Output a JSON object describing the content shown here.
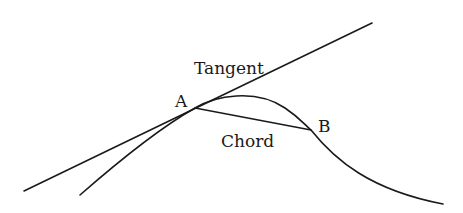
{
  "diagram": {
    "labels": {
      "tangent": "Tangent",
      "chord": "Chord",
      "point_a": "A",
      "point_b": "B"
    },
    "points": {
      "A": [
        195,
        108
      ],
      "B": [
        311,
        130
      ]
    },
    "colors": {
      "stroke": "#1a1a1a",
      "background": "#ffffff"
    }
  }
}
